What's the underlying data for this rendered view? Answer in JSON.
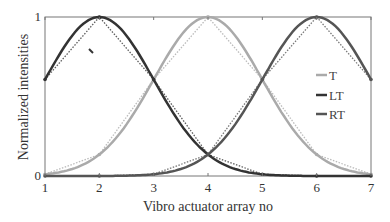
{
  "chart_data": {
    "type": "line",
    "title": "",
    "xlabel": "Vibro actuator array no",
    "ylabel": "Normalized intensities",
    "xlim": [
      1,
      7
    ],
    "ylim": [
      0,
      1
    ],
    "x_ticks": [
      1,
      2,
      3,
      4,
      5,
      6,
      7
    ],
    "y_ticks": [
      0,
      1
    ],
    "grid": false,
    "legend_position": "right-inside",
    "series": [
      {
        "name": "T",
        "color": "#aaaaaa",
        "peak": 4,
        "x": [
          1,
          1.5,
          2,
          2.5,
          3,
          3.5,
          4,
          4.5,
          5,
          5.5,
          6,
          6.5,
          7
        ],
        "values": [
          0.011,
          0.044,
          0.135,
          0.325,
          0.607,
          0.882,
          1.0,
          0.882,
          0.607,
          0.325,
          0.135,
          0.044,
          0.011
        ],
        "dotted_linear_points": [
          0.011,
          0.135,
          0.607,
          1.0,
          0.607,
          0.135,
          0.011
        ]
      },
      {
        "name": "LT",
        "color": "#333333",
        "peak": 2,
        "x": [
          1,
          1.5,
          2,
          2.5,
          3,
          3.5,
          4,
          4.5,
          5,
          5.5,
          6,
          6.5,
          7
        ],
        "values": [
          0.607,
          0.882,
          1.0,
          0.882,
          0.607,
          0.325,
          0.135,
          0.044,
          0.011,
          0.002,
          0.0,
          0.0,
          0.0
        ],
        "dotted_linear_points": [
          0.607,
          1.0,
          0.607,
          0.135,
          0.011,
          0.0,
          0.0
        ]
      },
      {
        "name": "RT",
        "color": "#555555",
        "peak": 6,
        "x": [
          1,
          1.5,
          2,
          2.5,
          3,
          3.5,
          4,
          4.5,
          5,
          5.5,
          6,
          6.5,
          7
        ],
        "values": [
          0.0,
          0.0,
          0.0,
          0.002,
          0.011,
          0.044,
          0.135,
          0.325,
          0.607,
          0.882,
          1.0,
          0.882,
          0.607
        ],
        "dotted_linear_points": [
          0.0,
          0.0,
          0.011,
          0.135,
          0.607,
          1.0,
          0.607
        ]
      }
    ]
  },
  "axes": {
    "xlabel": "Vibro actuator array no",
    "ylabel": "Normalized intensities",
    "x_tick_labels": [
      "1",
      "2",
      "3",
      "4",
      "5",
      "6",
      "7"
    ],
    "y_tick_labels": [
      "0",
      "1"
    ]
  },
  "legend": {
    "items": [
      {
        "label": "T",
        "color": "#aaaaaa"
      },
      {
        "label": "LT",
        "color": "#333333"
      },
      {
        "label": "RT",
        "color": "#555555"
      }
    ]
  }
}
